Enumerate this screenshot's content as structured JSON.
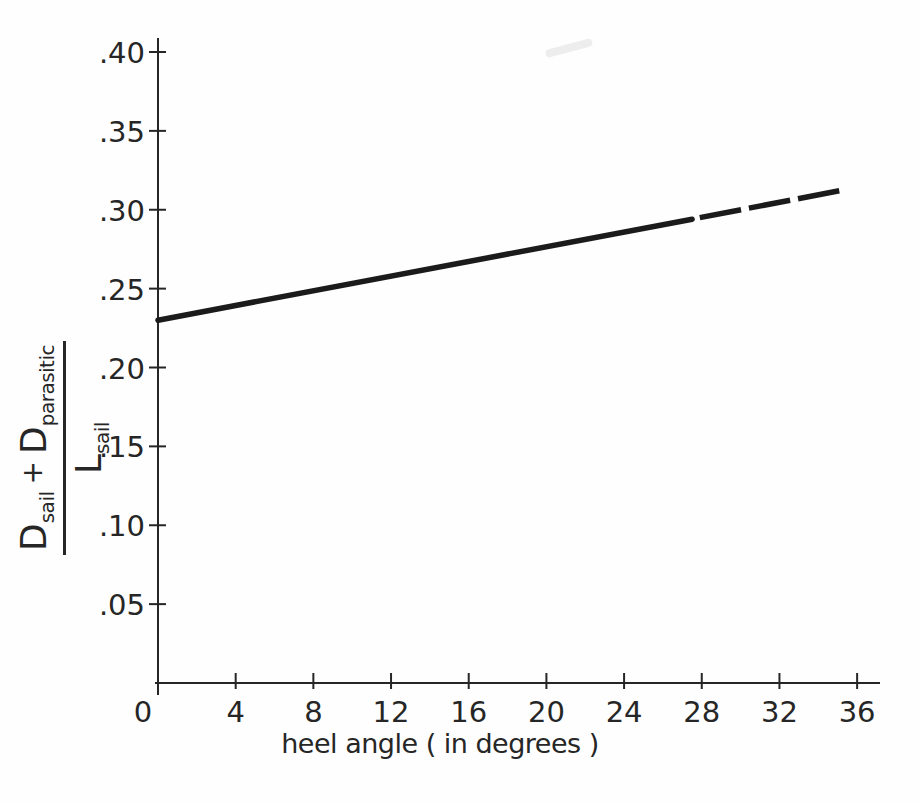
{
  "figure": {
    "background": "#fefefe",
    "ink_color": "#262626",
    "line_color": "#1b1b1b"
  },
  "chart_data": {
    "type": "line",
    "title": "",
    "xlabel": "heel angle ( in degrees )",
    "ylabel": "( D_sail + D_parasitic ) / L_sail",
    "x_ticks": [
      "0",
      "4",
      "8",
      "12",
      "16",
      "20",
      "24",
      "28",
      "32",
      "36"
    ],
    "y_ticks": [
      ".05",
      ".10",
      ".15",
      ".20",
      ".25",
      ".30",
      ".35",
      ".40"
    ],
    "xlim": [
      0,
      37
    ],
    "ylim": [
      0,
      0.41
    ],
    "grid": false,
    "legend": false,
    "series": [
      {
        "name": "solid-segment",
        "style": "solid",
        "points": [
          [
            0,
            0.23
          ],
          [
            27.5,
            0.294
          ]
        ]
      },
      {
        "name": "dashed-segment",
        "style": "dashed",
        "points": [
          [
            27.9,
            0.295
          ],
          [
            35.3,
            0.3125
          ]
        ]
      }
    ]
  },
  "y_axis_label": {
    "numerator": {
      "term1_base": "D",
      "term1_sub": "sail",
      "operator": "+",
      "term2_base": "D",
      "term2_sub": "parasitic"
    },
    "denominator": {
      "base": "L",
      "sub": "sail"
    }
  }
}
